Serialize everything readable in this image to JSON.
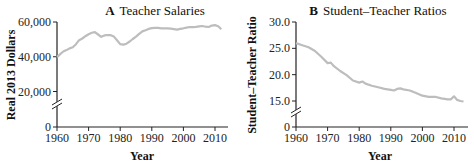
{
  "chart_data": [
    {
      "type": "line",
      "panel": "A",
      "title": "Teacher Salaries",
      "xlabel": "Year",
      "ylabel": "Real 2013 Dollars",
      "xlim": [
        1960,
        2013
      ],
      "ylim": [
        0,
        60000
      ],
      "axis_break": true,
      "xticks": [
        "1960",
        "1970",
        "1980",
        "1990",
        "2000",
        "2010"
      ],
      "yticks": [
        "0",
        "20,000",
        "40,000",
        "60,000"
      ],
      "line_color": "#bdbdbd",
      "x": [
        1960,
        1961,
        1962,
        1963,
        1964,
        1965,
        1966,
        1967,
        1968,
        1969,
        1970,
        1971,
        1972,
        1973,
        1974,
        1975,
        1976,
        1977,
        1978,
        1979,
        1980,
        1981,
        1982,
        1983,
        1984,
        1985,
        1986,
        1987,
        1988,
        1989,
        1990,
        1991,
        1992,
        1993,
        1994,
        1995,
        1996,
        1997,
        1998,
        1999,
        2000,
        2001,
        2002,
        2003,
        2004,
        2005,
        2006,
        2007,
        2008,
        2009,
        2010,
        2011,
        2012
      ],
      "values": [
        39800,
        41500,
        43000,
        43800,
        44800,
        45500,
        47200,
        49500,
        50500,
        51800,
        53000,
        53800,
        54200,
        52800,
        51500,
        52300,
        52500,
        52400,
        51600,
        49500,
        47300,
        47000,
        47500,
        48800,
        50200,
        51600,
        53200,
        54600,
        55300,
        56000,
        56500,
        56600,
        56600,
        56400,
        56300,
        56300,
        56200,
        55900,
        55600,
        56000,
        56400,
        56800,
        57100,
        57000,
        57200,
        57500,
        57700,
        57300,
        57100,
        57900,
        58200,
        57600,
        55800
      ]
    },
    {
      "type": "line",
      "panel": "B",
      "title": "Student–Teacher Ratios",
      "xlabel": "Year",
      "ylabel": "Student–Teacher Ratio",
      "xlim": [
        1960,
        2013
      ],
      "ylim": [
        0,
        30
      ],
      "axis_break": true,
      "xticks": [
        "1960",
        "1970",
        "1980",
        "1990",
        "2000",
        "2010"
      ],
      "yticks": [
        "0",
        "15.0",
        "20.0",
        "25.0",
        "30.0"
      ],
      "line_color": "#bdbdbd",
      "x": [
        1960,
        1962,
        1964,
        1966,
        1968,
        1970,
        1971,
        1972,
        1974,
        1976,
        1978,
        1980,
        1981,
        1982,
        1984,
        1986,
        1988,
        1990,
        1991,
        1992,
        1993,
        1994,
        1996,
        1998,
        2000,
        2002,
        2004,
        2006,
        2008,
        2009,
        2010,
        2011,
        2012,
        2013
      ],
      "values": [
        26.0,
        25.6,
        25.2,
        24.5,
        23.4,
        22.2,
        22.3,
        21.6,
        20.7,
        19.9,
        18.9,
        18.5,
        18.7,
        18.3,
        17.9,
        17.6,
        17.3,
        17.1,
        17.0,
        17.3,
        17.4,
        17.2,
        17.0,
        16.5,
        16.0,
        15.8,
        15.8,
        15.5,
        15.3,
        15.3,
        15.9,
        15.2,
        15.0,
        14.9
      ]
    }
  ],
  "panels": {
    "a": {
      "letter": "A",
      "title": "Teacher Salaries",
      "ylabel": "Real 2013 Dollars",
      "xlabel": "Year"
    },
    "b": {
      "letter": "B",
      "title": "Student–Teacher Ratios",
      "ylabel": "Student–Teacher Ratio",
      "xlabel": "Year"
    }
  }
}
